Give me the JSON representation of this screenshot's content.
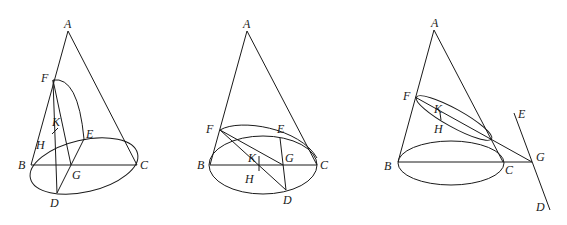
{
  "figures": [
    {
      "id": "figure-1",
      "labels": {
        "A": "A",
        "F": "F",
        "K": "K",
        "E": "E",
        "H": "H",
        "B": "B",
        "C": "C",
        "G": "G",
        "D": "D"
      }
    },
    {
      "id": "figure-2",
      "labels": {
        "A": "A",
        "F": "F",
        "E": "E",
        "K": "K",
        "G": "G",
        "B": "B",
        "C": "C",
        "H": "H",
        "D": "D"
      }
    },
    {
      "id": "figure-3",
      "labels": {
        "A": "A",
        "F": "F",
        "K": "K",
        "H": "H",
        "E": "E",
        "G": "G",
        "B": "B",
        "C": "C",
        "D": "D"
      }
    }
  ]
}
